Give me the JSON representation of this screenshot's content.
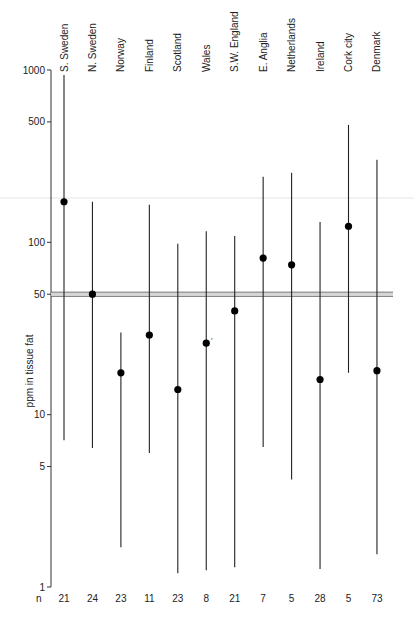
{
  "chart_data": {
    "type": "range-dot",
    "title": "",
    "xlabel": "",
    "ylabel": "ppm in tissue fat",
    "yscale": "log",
    "ylim": [
      1,
      1000
    ],
    "yticks": [
      1000,
      500,
      100,
      50,
      10,
      5,
      1
    ],
    "grid": false,
    "legend": null,
    "reference_line": {
      "value": 50,
      "style": "double"
    },
    "n_row_label": "n",
    "categories": [
      "S. Sweden",
      "N. Sweden",
      "Norway",
      "Finland",
      "Scotland",
      "Wales",
      "S.W. England",
      "E. Anglia",
      "Netherlands",
      "Ireland",
      "Cork city",
      "Denmark"
    ],
    "series": [
      {
        "name": "central value (dot)",
        "values": [
          172,
          50,
          17.5,
          29,
          14,
          26,
          40,
          81,
          74,
          16,
          124,
          18
        ]
      },
      {
        "name": "upper",
        "values": [
          935,
          172,
          30,
          165,
          98,
          116,
          109,
          240,
          253,
          131,
          480,
          301
        ]
      },
      {
        "name": "lower",
        "values": [
          7.1,
          6.4,
          1.7,
          6.0,
          1.2,
          1.25,
          1.3,
          6.5,
          4.2,
          1.27,
          17.5,
          1.55
        ]
      },
      {
        "name": "n",
        "values": [
          21,
          24,
          23,
          11,
          23,
          8,
          21,
          7,
          5,
          28,
          5,
          73
        ]
      }
    ]
  }
}
